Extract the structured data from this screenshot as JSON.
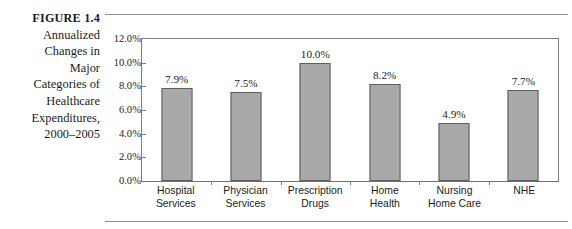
{
  "figure": {
    "label": "FIGURE 1.4",
    "caption_lines": [
      "Annualized",
      "Changes in",
      "Major",
      "Categories of",
      "Healthcare",
      "Expenditures,",
      "2000–2005"
    ]
  },
  "colors": {
    "bar_fill": "#a9a9a9",
    "bar_stroke": "#5d5d5d",
    "axis": "#7d7d7d",
    "rule": "#8e8e8e",
    "text": "#1b1b1b"
  },
  "chart_data": {
    "type": "bar",
    "title": "Annualized Changes in Major Categories of Healthcare Expenditures, 2000–2005",
    "xlabel": "",
    "ylabel": "",
    "categories": [
      "Hospital Services",
      "Physician Services",
      "Prescription Drugs",
      "Home Health",
      "Nursing Home Care",
      "NHE"
    ],
    "category_lines": [
      [
        "Hospital",
        "Services"
      ],
      [
        "Physician",
        "Services"
      ],
      [
        "Prescription",
        "Drugs"
      ],
      [
        "Home",
        "Health"
      ],
      [
        "Nursing",
        "Home Care"
      ],
      [
        "NHE"
      ]
    ],
    "values": [
      7.9,
      7.5,
      10.0,
      8.2,
      4.9,
      7.7
    ],
    "value_labels": [
      "7.9%",
      "7.5%",
      "10.0%",
      "8.2%",
      "4.9%",
      "7.7%"
    ],
    "ylim": [
      0,
      12
    ],
    "ytick_values": [
      12.0,
      10.0,
      8.0,
      6.0,
      4.0,
      2.0,
      0.0
    ],
    "ytick_labels": [
      "12.0%",
      "10.0%",
      "8.0%",
      "6.0%",
      "4.0%",
      "2.0%",
      "0.0%"
    ],
    "grid": false,
    "legend": false
  }
}
